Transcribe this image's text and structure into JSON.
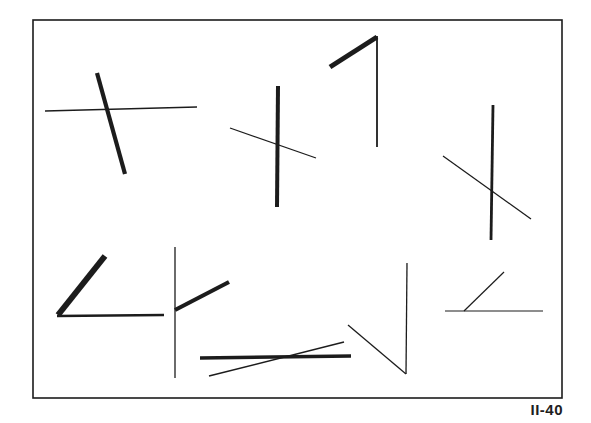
{
  "plate": {
    "label": "II-40",
    "ink_color": "#1c1c1c",
    "background": "#ffffff",
    "frame": {
      "x1": 33,
      "y1": 20,
      "x2": 562,
      "y2": 398,
      "stroke": 1.6
    }
  },
  "figures": [
    {
      "name": "figure-1-crossing",
      "lines": [
        {
          "x1": 45,
          "y1": 111,
          "x2": 197,
          "y2": 107,
          "w": 1.4
        },
        {
          "x1": 97,
          "y1": 73,
          "x2": 125,
          "y2": 174,
          "w": 4.2
        }
      ]
    },
    {
      "name": "figure-2-crossing",
      "lines": [
        {
          "x1": 230,
          "y1": 128,
          "x2": 316,
          "y2": 158,
          "w": 1.3
        },
        {
          "x1": 278,
          "y1": 86,
          "x2": 277,
          "y2": 207,
          "w": 4.0
        }
      ]
    },
    {
      "name": "figure-3-corner",
      "lines": [
        {
          "x1": 330,
          "y1": 67,
          "x2": 377,
          "y2": 37,
          "w": 5.0
        },
        {
          "x1": 377,
          "y1": 36,
          "x2": 377,
          "y2": 147,
          "w": 1.8
        }
      ]
    },
    {
      "name": "figure-4-crossing",
      "lines": [
        {
          "x1": 443,
          "y1": 156,
          "x2": 531,
          "y2": 219,
          "w": 1.3
        },
        {
          "x1": 493,
          "y1": 105,
          "x2": 491,
          "y2": 240,
          "w": 2.8
        }
      ]
    },
    {
      "name": "figure-5-angle",
      "lines": [
        {
          "x1": 58,
          "y1": 315,
          "x2": 105,
          "y2": 256,
          "w": 6.0
        },
        {
          "x1": 57,
          "y1": 316,
          "x2": 164,
          "y2": 315,
          "w": 2.4
        }
      ]
    },
    {
      "name": "figure-6-t-junction",
      "lines": [
        {
          "x1": 175,
          "y1": 247,
          "x2": 175,
          "y2": 378,
          "w": 1.3
        },
        {
          "x1": 175,
          "y1": 310,
          "x2": 229,
          "y2": 282,
          "w": 4.2
        }
      ]
    },
    {
      "name": "figure-7-crossing",
      "lines": [
        {
          "x1": 200,
          "y1": 358,
          "x2": 351,
          "y2": 356,
          "w": 3.4
        },
        {
          "x1": 209,
          "y1": 376,
          "x2": 344,
          "y2": 342,
          "w": 1.5
        }
      ]
    },
    {
      "name": "figure-8-v-angle",
      "lines": [
        {
          "x1": 348,
          "y1": 325,
          "x2": 406,
          "y2": 374,
          "w": 1.3
        },
        {
          "x1": 407,
          "y1": 263,
          "x2": 406,
          "y2": 374,
          "w": 1.3
        }
      ]
    },
    {
      "name": "figure-9-angle",
      "lines": [
        {
          "x1": 445,
          "y1": 311,
          "x2": 543,
          "y2": 311,
          "w": 1.2
        },
        {
          "x1": 464,
          "y1": 311,
          "x2": 504,
          "y2": 272,
          "w": 1.2
        }
      ]
    }
  ]
}
